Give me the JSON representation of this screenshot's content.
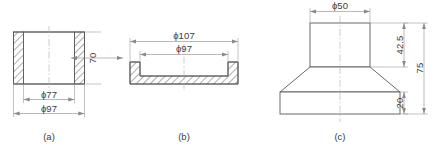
{
  "figure": {
    "type": "engineering-drawing",
    "style": "orthographic section views",
    "parts": [
      {
        "id": "a",
        "caption": "(a)",
        "description": "hollow cylindrical sleeve, sectioned with hatched walls",
        "dimensions": [
          {
            "name": "inner-diameter",
            "label": "ϕ77",
            "value": 77,
            "symbol": "ϕ",
            "orientation": "horizontal"
          },
          {
            "name": "outer-diameter",
            "label": "ϕ97",
            "value": 97,
            "symbol": "ϕ",
            "orientation": "horizontal"
          },
          {
            "name": "height",
            "label": "70",
            "value": 70,
            "symbol": "",
            "orientation": "vertical"
          }
        ]
      },
      {
        "id": "b",
        "caption": "(b)",
        "description": "shallow tray / lid, sectioned with hatched base and side walls",
        "dimensions": [
          {
            "name": "outer-diameter",
            "label": "ϕ107",
            "value": 107,
            "symbol": "ϕ",
            "orientation": "horizontal"
          },
          {
            "name": "inner-diameter",
            "label": "ϕ97",
            "value": 97,
            "symbol": "ϕ",
            "orientation": "horizontal"
          }
        ]
      },
      {
        "id": "c",
        "caption": "(c)",
        "description": "stepped tapered boss: cylindrical top, conical transition, rectangular base",
        "dimensions": [
          {
            "name": "top-diameter",
            "label": "ϕ50",
            "value": 50,
            "symbol": "ϕ",
            "orientation": "horizontal"
          },
          {
            "name": "upper-height",
            "label": "42.5",
            "value": 42.5,
            "symbol": "",
            "orientation": "vertical"
          },
          {
            "name": "base-height",
            "label": "20",
            "value": 20,
            "symbol": "",
            "orientation": "vertical"
          },
          {
            "name": "overall-height",
            "label": "75",
            "value": 75,
            "symbol": "",
            "orientation": "vertical"
          }
        ]
      }
    ]
  },
  "colors": {
    "outline": "#5a5a5a",
    "dimension": "#8a8a8a",
    "centerline": "#b0a8a8",
    "text": "#3d3d3d",
    "background": "#ffffff"
  }
}
